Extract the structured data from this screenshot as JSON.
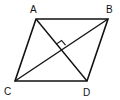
{
  "diagram": {
    "type": "rhombus-with-diagonals",
    "vertices": {
      "A": {
        "label": "A",
        "x": 36,
        "y": 19
      },
      "B": {
        "label": "B",
        "x": 108,
        "y": 19
      },
      "C": {
        "label": "C",
        "x": 15,
        "y": 81
      },
      "D": {
        "label": "D",
        "x": 87,
        "y": 81
      }
    },
    "edges": [
      [
        "A",
        "B"
      ],
      [
        "B",
        "D"
      ],
      [
        "D",
        "C"
      ],
      [
        "C",
        "A"
      ]
    ],
    "diagonals": [
      [
        "A",
        "D"
      ],
      [
        "C",
        "B"
      ]
    ],
    "right_angle_marker": {
      "at": "intersection",
      "x": 61,
      "y": 50
    },
    "line_color": "#111111",
    "background": "#ffffff"
  }
}
